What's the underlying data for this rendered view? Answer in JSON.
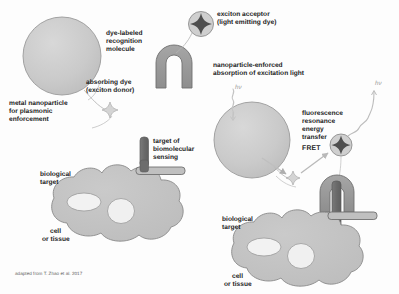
{
  "figure": {
    "credit": "adapted from T. Zhao et al. 2017"
  },
  "palette": {
    "nanoparticle_fill": "#c9c9c9",
    "nanoparticle_stroke": "#8f8f8f",
    "cell_fill": "#c2c2c2",
    "cell_stroke": "#8a8a8a",
    "nucleus_fill": "#efefef",
    "molecule_fill": "#9a9a9a",
    "molecule_stroke": "#6e6e6e",
    "target_rod_fill": "#6d6d6d",
    "acceptor_star_fill": "#4a4a4a",
    "donor_star_fill": "#d2d2d2",
    "text_color": "#1d1d1d",
    "leader_line": "#b4b4b4",
    "arrow_gray": "#b9b9b9",
    "photon_text": "#9a9a9a"
  },
  "left_panel": {
    "name": "components-panel",
    "labels": {
      "metal_nanoparticle": "metal nanoparticle\nfor plasmonic\nenforcement",
      "absorbing_dye": "absorbing dye\n(exciton donor)",
      "recognition_molecule": "dye-labeled\nrecognition\nmolecule",
      "exciton_acceptor": "exciton acceptor\n(light emitting dye)",
      "target_of_sensing": "target of\nbiomolecular\nsensing",
      "biological_target": "biological\ntarget",
      "cell_or_tissue": "cell\nor tissue"
    }
  },
  "right_panel": {
    "name": "assembled-sensing-panel",
    "labels": {
      "absorption": "nanoparticle-enforced\nabsorption of excitation light",
      "fret_full": "fluorescence\nresonance\nenergy\ntransfer",
      "fret_acronym": "FRET",
      "biological_target": "biological\ntarget",
      "cell_or_tissue": "cell\nor tissue",
      "excitation_photon": "hν",
      "emission_photon": "hν"
    }
  },
  "icons": {
    "nanoparticle": "sphere-icon",
    "donor_dye": "four-point-star-icon",
    "acceptor_dye": "four-point-star-in-circle-icon",
    "recognition_molecule": "horseshoe-molecule-icon",
    "target_rod": "rod-target-icon",
    "cell": "cell-blob-icon",
    "photon_squiggle": "squiggle-arrow-icon",
    "fret_arrow": "arrow-icon"
  }
}
